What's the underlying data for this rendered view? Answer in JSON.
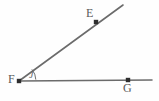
{
  "figure": {
    "type": "geometry-diagram",
    "background_color": "#fefefe",
    "stroke_color": "#6b6b6b",
    "point_color": "#2e2e2e",
    "label_color": "#5a5a5a",
    "width": 159,
    "height": 101
  },
  "points": [
    {
      "id": "E",
      "label": "E",
      "x": 96,
      "y": 22,
      "label_x": 86,
      "label_y": 7,
      "marker": "square-dot"
    },
    {
      "id": "F",
      "label": "F",
      "x": 19,
      "y": 81,
      "label_x": 8,
      "label_y": 73,
      "marker": "square-dot"
    },
    {
      "id": "G",
      "label": "G",
      "x": 128,
      "y": 80,
      "label_x": 123,
      "label_y": 82,
      "marker": "square-dot"
    }
  ],
  "rays": [
    {
      "id": "ray-FE",
      "from": "F",
      "through": "E",
      "start_x": 19,
      "start_y": 81,
      "end_x": 123,
      "end_y": 5,
      "stroke_width": 1.6
    },
    {
      "id": "ray-FG",
      "from": "F",
      "through": "G",
      "start_x": 19,
      "start_y": 81,
      "end_x": 152,
      "end_y": 80,
      "stroke_width": 1.6
    }
  ],
  "angle": {
    "id": "angle-EFG",
    "vertex": "F",
    "label": "J",
    "label_x": 29,
    "label_y": 70,
    "arc_radius": 16,
    "arc_path": "M 35.8 79.6 A 16 16 0 0 0 31.9 69.4"
  }
}
